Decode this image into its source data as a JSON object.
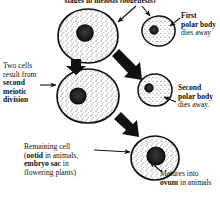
{
  "figure": {
    "title": "stages in meiosis (oogenesis)",
    "width": 220,
    "height": 198
  },
  "labels": {
    "first_polar_body": {
      "line1_bold": "First",
      "line2_bold": "polar body",
      "line3": "dies away"
    },
    "two_cells": {
      "line1": "Two cells",
      "line2": "result from",
      "line3_bold": "second",
      "line4_bold": "meiotic",
      "line5_bold": "division"
    },
    "second_polar_body": {
      "line1_bold": "Second",
      "line2_bold": "polar body",
      "line3": "dies away."
    },
    "remaining_cell": {
      "line1": "Remaining cell",
      "line2_prefix": "(",
      "line2_bold": "ootid",
      "line2_suffix": " in animals,",
      "line3_bold": "embryo sac",
      "line3_suffix": " in",
      "line4": "flowering plants)"
    },
    "matures_into_ovum": {
      "line1": "Matures into",
      "line2_bold": "ovum",
      "line2_suffix": " in animals"
    }
  },
  "cells": [
    {
      "name": "primary-oocyte",
      "role": "large cell top left, stippled cytoplasm with dark nucleus",
      "cx": 88,
      "cy": 36,
      "rx": 30,
      "ry": 26,
      "nucleus_cx": 85,
      "nucleus_cy": 33,
      "nucleus_r": 8
    },
    {
      "name": "first-polar-body",
      "role": "small irregular cell upper right",
      "cx": 158,
      "cy": 31,
      "rx": 17,
      "ry": 15,
      "nucleus_cx": 154,
      "nucleus_cy": 30,
      "nucleus_r": 4
    },
    {
      "name": "secondary-oocyte",
      "role": "large cell middle left",
      "cx": 88,
      "cy": 96,
      "rx": 31,
      "ry": 27,
      "nucleus_cx": 78,
      "nucleus_cy": 96,
      "nucleus_r": 8
    },
    {
      "name": "second-polar-body",
      "role": "small irregular cell middle right",
      "cx": 155,
      "cy": 90,
      "rx": 17,
      "ry": 16,
      "nucleus_cx": 149,
      "nucleus_cy": 88,
      "nucleus_r": 4
    },
    {
      "name": "ootid-cell",
      "role": "final cell bottom right, becomes ovum",
      "cx": 155,
      "cy": 158,
      "rx": 24,
      "ry": 22,
      "nucleus_cx": 156,
      "nucleus_cy": 156,
      "nucleus_r": 9
    }
  ],
  "arrows": {
    "thick": [
      {
        "name": "arrow-oocyte-down",
        "from_x": 76,
        "from_y": 58,
        "to_x": 76,
        "to_y": 72
      },
      {
        "name": "arrow-oocyte-to-polar-body",
        "from_x": 110,
        "from_y": 56,
        "to_x": 136,
        "to_y": 78
      },
      {
        "name": "arrow-secondary-to-ootid",
        "from_x": 112,
        "from_y": 122,
        "to_x": 134,
        "to_y": 140
      }
    ],
    "thin": [
      {
        "name": "pointer-to-first-polar-body",
        "from_x": 178,
        "from_y": 18,
        "to_x": 168,
        "to_y": 26
      },
      {
        "name": "pointer-from-oocyte-top",
        "from_x": 134,
        "from_y": 10,
        "to_x": 116,
        "to_y": 23
      },
      {
        "name": "pointer-from-polar-body-top",
        "from_x": 140,
        "from_y": 9,
        "to_x": 148,
        "to_y": 18
      },
      {
        "name": "pointer-second-meiotic",
        "from_x": 43,
        "from_y": 85,
        "to_x": 57,
        "to_y": 85
      },
      {
        "name": "pointer-to-second-polar-body",
        "from_x": 175,
        "from_y": 101,
        "to_x": 163,
        "to_y": 96
      },
      {
        "name": "pointer-to-remaining-cell",
        "from_x": 96,
        "from_y": 150,
        "to_x": 131,
        "to_y": 152
      },
      {
        "name": "pointer-to-ootid-from-caption",
        "from_x": 160,
        "from_y": 172,
        "to_x": 150,
        "to_y": 163
      }
    ]
  },
  "colors": {
    "ink": "#111111",
    "background": "#ffffff",
    "nucleus": "#1a1a1a",
    "cytoplasm_stipple": "#4a4a4a"
  }
}
